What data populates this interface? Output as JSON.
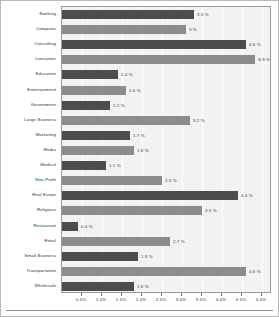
{
  "chart_data": {
    "type": "bar",
    "orientation": "horizontal",
    "title": "",
    "xlabel": "",
    "ylabel": "",
    "xlim": [
      0,
      5.25
    ],
    "grid": true,
    "legend": null,
    "value_suffix": "%",
    "xticks": [
      "0.5%",
      "1.0%",
      "1.5%",
      "2.0%",
      "2.5%",
      "3.0%",
      "3.5%",
      "4.0%",
      "4.5%",
      "5.0%"
    ],
    "xtick_values": [
      0.5,
      1.0,
      1.5,
      2.0,
      2.5,
      3.0,
      3.5,
      4.0,
      4.5,
      5.0
    ],
    "categories": [
      "Banking",
      "Computer",
      "Consulting",
      "Consumer",
      "Education",
      "Entertainment",
      "Government",
      "Large Business",
      "Marketing",
      "Media",
      "Medical",
      "Non-Profit",
      "Real Estate",
      "Religious",
      "Restaurant",
      "Retail",
      "Small Business",
      "Transportation",
      "Wholesale"
    ],
    "values": [
      3.3,
      3.1,
      4.6,
      8.9,
      1.4,
      1.6,
      1.2,
      3.2,
      1.7,
      1.8,
      1.1,
      2.5,
      4.4,
      3.5,
      0.4,
      2.7,
      1.9,
      4.6,
      1.8
    ],
    "labels": [
      "3.3 %",
      "3 %",
      "4.6 %",
      "8.9 %",
      "1.4 %",
      "1.6 %",
      "1.2 %",
      "3.2 %",
      "1.7 %",
      "1.8 %",
      "1.1 %",
      "2.5 %",
      "4.4 %",
      "3.5 %",
      "0.4 %",
      "2.7 %",
      "1.9 %",
      "4.6 %",
      "1.8 %"
    ],
    "bar_colors": [
      "#4d4d4d",
      "#8c8c8c"
    ],
    "plot_background": "#f2f2f0"
  }
}
